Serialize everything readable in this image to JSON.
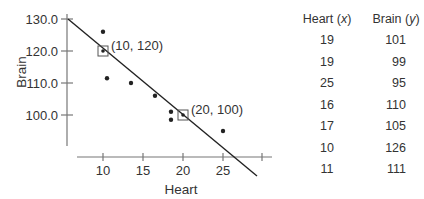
{
  "chart_data": {
    "type": "scatter",
    "title": "",
    "xlabel": "Heart",
    "ylabel": "Brain",
    "x_ticks": [
      "10",
      "15",
      "20",
      "25"
    ],
    "y_ticks": [
      "100.0",
      "110.0",
      "120.0",
      "130.0"
    ],
    "xlim": [
      6.5,
      31
    ],
    "ylim": [
      91,
      130
    ],
    "grid": false,
    "points": [
      {
        "x": 10,
        "y": 126
      },
      {
        "x": 10.5,
        "y": 111.5
      },
      {
        "x": 13.5,
        "y": 110
      },
      {
        "x": 16.5,
        "y": 106
      },
      {
        "x": 18.5,
        "y": 101
      },
      {
        "x": 18.5,
        "y": 98.5
      },
      {
        "x": 25,
        "y": 95
      }
    ],
    "regression_line": {
      "from": {
        "x": 6.5,
        "y": 130
      },
      "to": {
        "x": 28,
        "y": 88
      }
    },
    "annotations": [
      {
        "x": 10,
        "y": 120,
        "label": "(10, 120)",
        "marker": "square"
      },
      {
        "x": 20,
        "y": 100,
        "label": "(20, 100)",
        "marker": "square"
      }
    ]
  },
  "table": {
    "headers": {
      "x_name": "Heart",
      "x_var": "x",
      "y_name": "Brain",
      "y_var": "y"
    },
    "rows": [
      {
        "heart": "19",
        "brain": "101"
      },
      {
        "heart": "19",
        "brain": "99"
      },
      {
        "heart": "25",
        "brain": "95"
      },
      {
        "heart": "16",
        "brain": "110"
      },
      {
        "heart": "17",
        "brain": "105"
      },
      {
        "heart": "10",
        "brain": "126"
      },
      {
        "heart": "11",
        "brain": "111"
      }
    ]
  }
}
